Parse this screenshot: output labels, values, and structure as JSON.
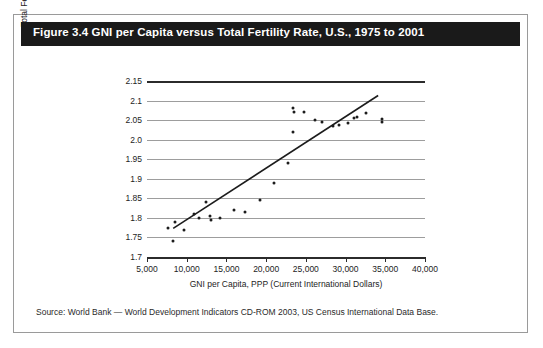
{
  "figure": {
    "title": "Figure 3.4 GNI per Capita versus Total Fertility Rate, U.S., 1975 to 2001",
    "source": "Source: World Bank — World Development Indicators CD-ROM 2003, US Census International Data Base."
  },
  "chart_data": {
    "type": "scatter",
    "title": "Figure 3.4 GNI per Capita versus Total Fertility Rate, U.S., 1975 to 2001",
    "xlabel": "GNI per Capita, PPP (Current International Dollars)",
    "ylabel": "Total Fertility Rate",
    "xlim": [
      5000,
      40000
    ],
    "ylim": [
      1.7,
      2.15
    ],
    "xticks": [
      5000,
      10000,
      15000,
      20000,
      25000,
      30000,
      35000,
      40000
    ],
    "xtick_labels": [
      "5,000",
      "10,000",
      "15,000",
      "20,000",
      "25,000",
      "30,000",
      "35,000",
      "40,000"
    ],
    "yticks": [
      1.7,
      1.75,
      1.8,
      1.85,
      1.9,
      1.95,
      2.0,
      2.05,
      2.1,
      2.15
    ],
    "ytick_labels": [
      "1.7",
      "1.75",
      "1.8",
      "1.85",
      "1.9",
      "1.95",
      "2.0",
      "2.05",
      "2.1",
      "2.15"
    ],
    "grid": "horizontal",
    "legend": "none",
    "marker_color": "#1c1c1c",
    "gridline_color": "#9d9d9d",
    "axis_color": "#2b2b2b",
    "points": [
      {
        "x": 7600,
        "y": 1.775
      },
      {
        "x": 8300,
        "y": 1.74
      },
      {
        "x": 8500,
        "y": 1.79
      },
      {
        "x": 9600,
        "y": 1.77
      },
      {
        "x": 10900,
        "y": 1.81
      },
      {
        "x": 11600,
        "y": 1.8
      },
      {
        "x": 12400,
        "y": 1.84
      },
      {
        "x": 12900,
        "y": 1.805
      },
      {
        "x": 13000,
        "y": 1.795
      },
      {
        "x": 14200,
        "y": 1.8
      },
      {
        "x": 16000,
        "y": 1.82
      },
      {
        "x": 17300,
        "y": 1.815
      },
      {
        "x": 19200,
        "y": 1.845
      },
      {
        "x": 21000,
        "y": 1.89
      },
      {
        "x": 22700,
        "y": 1.94
      },
      {
        "x": 23400,
        "y": 2.08
      },
      {
        "x": 23500,
        "y": 2.072
      },
      {
        "x": 23400,
        "y": 2.02
      },
      {
        "x": 24800,
        "y": 2.072
      },
      {
        "x": 26200,
        "y": 2.05
      },
      {
        "x": 27000,
        "y": 2.045
      },
      {
        "x": 28400,
        "y": 2.035
      },
      {
        "x": 29200,
        "y": 2.038
      },
      {
        "x": 30300,
        "y": 2.042
      },
      {
        "x": 31100,
        "y": 2.055
      },
      {
        "x": 31400,
        "y": 2.058
      },
      {
        "x": 32600,
        "y": 2.068
      },
      {
        "x": 34600,
        "y": 2.052
      },
      {
        "x": 34600,
        "y": 2.046
      }
    ],
    "trendline": {
      "x0": 8300,
      "y0": 1.773,
      "x1": 34100,
      "y1": 2.113,
      "color": "#1c1c1c"
    }
  }
}
